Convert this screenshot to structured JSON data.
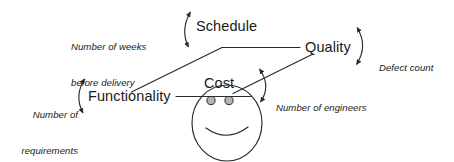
{
  "diagram": {
    "type": "concept-diagram",
    "stroke_color": "#2b2b2b",
    "text_color": "#1a1a1a",
    "eye_fill_color": "#b3b3b3",
    "background_color": "#ffffff",
    "nodes": [
      {
        "id": "schedule",
        "label": "Schedule"
      },
      {
        "id": "quality",
        "label": "Quality"
      },
      {
        "id": "cost",
        "label": "Cost"
      },
      {
        "id": "functionality",
        "label": "Functionality"
      }
    ],
    "metrics": [
      {
        "id": "weeks",
        "for": "schedule",
        "line1": "Number of weeks",
        "line2": "before delivery"
      },
      {
        "id": "defects",
        "for": "quality",
        "line1": "Defect count",
        "line2": ""
      },
      {
        "id": "engineers",
        "for": "cost",
        "line1": "Number of engineers",
        "line2": ""
      },
      {
        "id": "requirements",
        "for": "functionality",
        "line1": "Number of",
        "line2": "requirements"
      }
    ],
    "connectors": [
      {
        "id": "schedule-arc",
        "kind": "double-headed-curved-arrow",
        "bows": "left"
      },
      {
        "id": "quality-arc",
        "kind": "double-headed-curved-arrow",
        "bows": "right"
      },
      {
        "id": "cost-arc",
        "kind": "double-headed-curved-arrow",
        "bows": "right"
      },
      {
        "id": "functionality-arc",
        "kind": "double-headed-curved-arrow",
        "bows": "left"
      }
    ],
    "face": {
      "id": "smiley-face",
      "features": [
        "head-outline",
        "left-eye",
        "right-eye",
        "smile",
        "hat-brim"
      ]
    }
  }
}
